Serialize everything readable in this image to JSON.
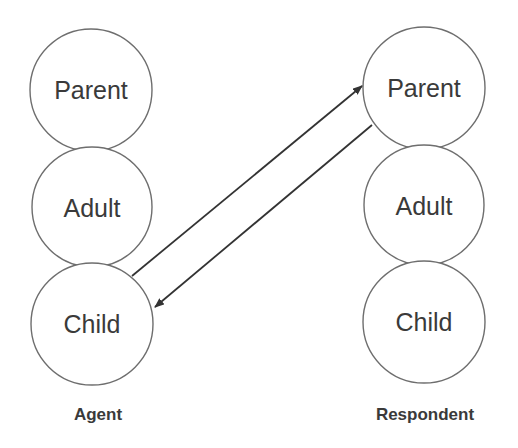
{
  "diagram": {
    "type": "transactional-analysis",
    "actors": [
      {
        "id": "agent",
        "caption": "Agent",
        "states": [
          {
            "id": "parent",
            "label": "Parent"
          },
          {
            "id": "adult",
            "label": "Adult"
          },
          {
            "id": "child",
            "label": "Child"
          }
        ]
      },
      {
        "id": "respondent",
        "caption": "Respondent",
        "states": [
          {
            "id": "parent",
            "label": "Parent"
          },
          {
            "id": "adult",
            "label": "Adult"
          },
          {
            "id": "child",
            "label": "Child"
          }
        ]
      }
    ],
    "edges": [
      {
        "from": "agent.child",
        "to": "respondent.parent"
      },
      {
        "from": "respondent.parent",
        "to": "agent.child"
      }
    ],
    "colors": {
      "stroke": "#6e6e6e",
      "text": "#3a3a3a",
      "arrow": "#333333",
      "background": "#ffffff"
    }
  }
}
